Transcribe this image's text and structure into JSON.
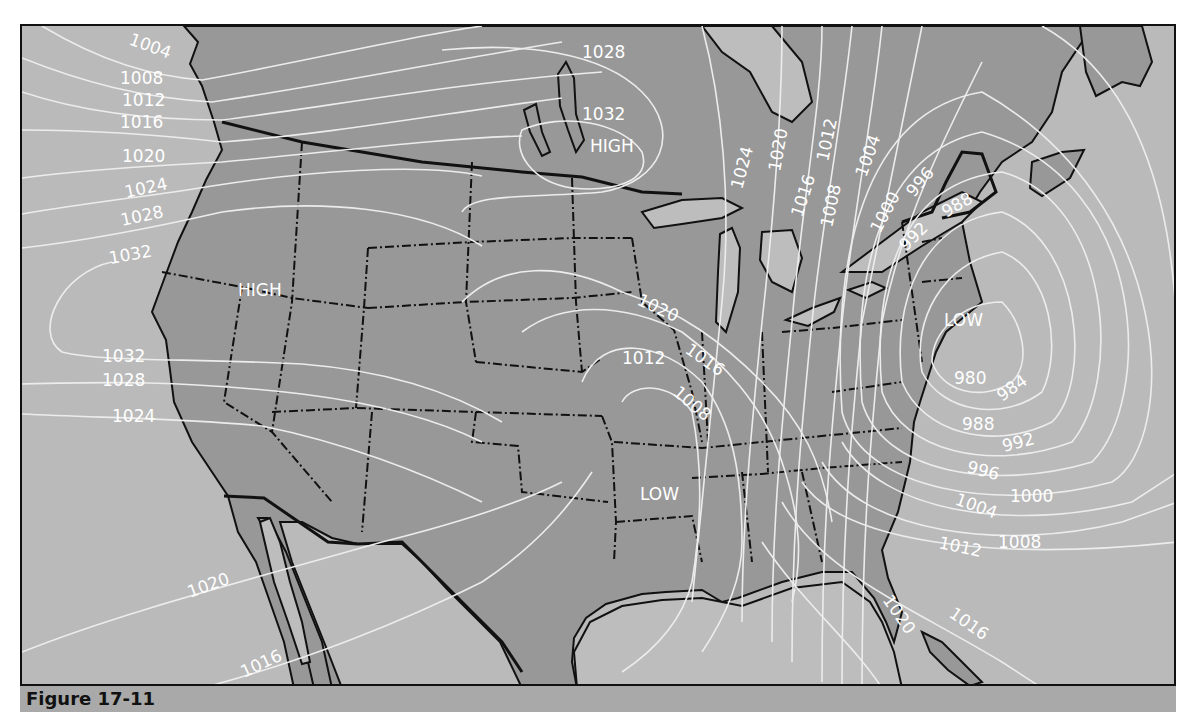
{
  "figure": {
    "caption": "Figure 17-11"
  },
  "map": {
    "type": "surface weather map (isobars, mb)",
    "colors": {
      "water": "#b9b9b9",
      "land": "#989898",
      "isobar": "#ececec",
      "label": "#ffffff",
      "border": "#111111"
    },
    "pressure_centers": [
      {
        "type": "HIGH",
        "location": "Central Canada (north of Minnesota)"
      },
      {
        "type": "HIGH",
        "location": "Nevada / Oregon border"
      },
      {
        "type": "LOW",
        "location": "Arkansas"
      },
      {
        "type": "LOW",
        "location": "off New England coast"
      }
    ],
    "isobar_labels": [
      "1004",
      "1008",
      "1012",
      "1016",
      "1020",
      "1024",
      "1028",
      "1032",
      "1028",
      "1032",
      "1024",
      "1020",
      "1016",
      "1012",
      "1008",
      "1004",
      "1000",
      "996",
      "992",
      "988",
      "1032",
      "1028",
      "1024",
      "1020",
      "1016",
      "1012",
      "1008",
      "980",
      "984",
      "988",
      "992",
      "996",
      "1000",
      "1004",
      "1008",
      "1012",
      "1016",
      "1020",
      "1020",
      "1016"
    ],
    "labels": {
      "high_canada": "HIGH",
      "high_west": "HIGH",
      "low_central": "LOW",
      "low_east": "LOW",
      "nw": {
        "l1004": "1004",
        "l1008": "1008",
        "l1012": "1012",
        "l1016": "1016",
        "l1020": "1020",
        "l1024": "1024",
        "l1028": "1028",
        "l1032": "1032"
      },
      "canada": {
        "l1028": "1028",
        "l1032": "1032"
      },
      "northeast": {
        "l1024": "1024",
        "l1020": "1020",
        "l1016": "1016",
        "l1012": "1012",
        "l1008": "1008",
        "l1004": "1004",
        "l1000": "1000",
        "l996": "996",
        "l992": "992",
        "l988": "988"
      },
      "west": {
        "l1032": "1032",
        "l1028": "1028",
        "l1024": "1024"
      },
      "central": {
        "l1020": "1020",
        "l1016": "1016",
        "l1012": "1012",
        "l1008": "1008"
      },
      "atlantic": {
        "l980": "980",
        "l984": "984",
        "l988": "988",
        "l992": "992",
        "l996": "996",
        "l1000": "1000",
        "l1004": "1004",
        "l1008": "1008",
        "l1012": "1012",
        "l1016": "1016",
        "l1020": "1020"
      },
      "southwest": {
        "l1020": "1020",
        "l1016": "1016"
      }
    }
  }
}
